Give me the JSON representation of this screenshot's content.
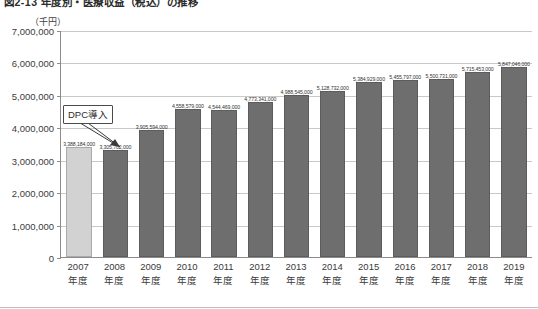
{
  "figure": {
    "caption": "図2-13  年度別・医療収益（税込）の推移",
    "unit_label": "（千円）"
  },
  "annotation": {
    "label": "DPC導入",
    "points_to_category": "2008年度"
  },
  "colors": {
    "bar_default": "#6e6e6e",
    "bar_highlight": "#d2d2d2",
    "axis": "#8c8c8c",
    "gridline": "#c9c9c9",
    "text": "#3a3a3a"
  },
  "chart_data": {
    "type": "bar",
    "title": "図2-13  年度別・医療収益（税込）の推移",
    "xlabel": "",
    "ylabel": "（千円）",
    "ylim": [
      0,
      7000000
    ],
    "ytick_values": [
      0,
      1000000,
      2000000,
      3000000,
      4000000,
      5000000,
      6000000,
      7000000
    ],
    "ytick_labels": [
      "0",
      "1,000,000",
      "2,000,000",
      "3,000,000",
      "4,000,000",
      "5,000,000",
      "6,000,000",
      "7,000,000"
    ],
    "grid": true,
    "legend": false,
    "categories": [
      "2007年度",
      "2008年度",
      "2009年度",
      "2010年度",
      "2011年度",
      "2012年度",
      "2013年度",
      "2014年度",
      "2015年度",
      "2016年度",
      "2017年度",
      "2018年度",
      "2019年度"
    ],
    "category_lines": [
      {
        "year": "2007",
        "nendo": "年度"
      },
      {
        "year": "2008",
        "nendo": "年度"
      },
      {
        "year": "2009",
        "nendo": "年度"
      },
      {
        "year": "2010",
        "nendo": "年度"
      },
      {
        "year": "2011",
        "nendo": "年度"
      },
      {
        "year": "2012",
        "nendo": "年度"
      },
      {
        "year": "2013",
        "nendo": "年度"
      },
      {
        "year": "2014",
        "nendo": "年度"
      },
      {
        "year": "2015",
        "nendo": "年度"
      },
      {
        "year": "2016",
        "nendo": "年度"
      },
      {
        "year": "2017",
        "nendo": "年度"
      },
      {
        "year": "2018",
        "nendo": "年度"
      },
      {
        "year": "2019",
        "nendo": "年度"
      }
    ],
    "values": [
      3388184000,
      3305702000,
      3905594000,
      4558579000,
      4544469000,
      4773341000,
      4988545000,
      5128732000,
      5384929000,
      5455797000,
      5500731000,
      5715453000,
      5847046000
    ],
    "bar_plot_values": [
      3388184,
      3305702,
      3905594,
      4558579,
      4544469,
      4773341,
      4988545,
      5128732,
      5384929,
      5455797,
      5500731,
      5715453,
      5847046
    ],
    "data_labels": [
      "3,388,184,000",
      "3,305,702,000",
      "3,905,594,000",
      "4,558,579,000",
      "4,544,469,000",
      "4,773,341,000",
      "4,988,545,000",
      "5,128,732,000",
      "5,384,929,000",
      "5,455,797,000",
      "5,500,731,000",
      "5,715,453,000",
      "5,847,046,000"
    ],
    "highlight_index": 0,
    "annotations": [
      {
        "text": "DPC導入",
        "target_category": "2008年度"
      }
    ]
  }
}
